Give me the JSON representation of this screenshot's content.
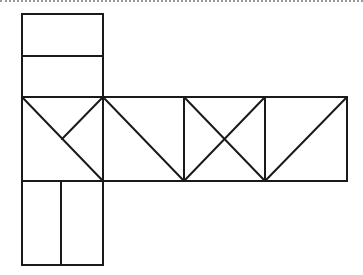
{
  "diagram": {
    "stroke_color": "#1a1a1a",
    "background": "#ffffff",
    "stroke_width": 2,
    "top_border": {
      "style": "dotted",
      "color": "#9a9a9a"
    },
    "rects": [
      {
        "id": "top-upper-rect",
        "x": 22,
        "y": 14,
        "w": 81,
        "h": 42
      },
      {
        "id": "top-lower-rect",
        "x": 22,
        "y": 56,
        "w": 81,
        "h": 41
      },
      {
        "id": "row-square-1",
        "x": 22,
        "y": 97,
        "w": 81,
        "h": 84
      },
      {
        "id": "row-square-2",
        "x": 103,
        "y": 97,
        "w": 81,
        "h": 84
      },
      {
        "id": "row-square-3",
        "x": 184,
        "y": 97,
        "w": 81,
        "h": 84
      },
      {
        "id": "row-square-4",
        "x": 265,
        "y": 97,
        "w": 82,
        "h": 84
      },
      {
        "id": "bottom-left-rect",
        "x": 22,
        "y": 181,
        "w": 39,
        "h": 84
      },
      {
        "id": "bottom-right-rect",
        "x": 61,
        "y": 181,
        "w": 42,
        "h": 84
      }
    ],
    "lines": [
      {
        "id": "square1-main-diagonal",
        "x1": 22,
        "y1": 97,
        "x2": 103,
        "y2": 181
      },
      {
        "id": "square1-half-diagonal",
        "x1": 103,
        "y1": 97,
        "x2": 62,
        "y2": 139
      },
      {
        "id": "square2-diagonal",
        "x1": 103,
        "y1": 97,
        "x2": 184,
        "y2": 181
      },
      {
        "id": "square3-diagonal-a",
        "x1": 184,
        "y1": 97,
        "x2": 265,
        "y2": 181
      },
      {
        "id": "square3-diagonal-b",
        "x1": 265,
        "y1": 97,
        "x2": 184,
        "y2": 181
      },
      {
        "id": "square4-diagonal",
        "x1": 347,
        "y1": 97,
        "x2": 265,
        "y2": 181
      }
    ]
  }
}
